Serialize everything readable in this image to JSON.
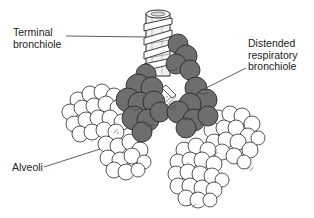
{
  "diagram": {
    "labels": [
      {
        "id": "terminal-bronchiole",
        "line1": "Terminal",
        "line2": "bronchiole"
      },
      {
        "id": "distended-respiratory-bronchiole",
        "line1": "Distended",
        "line2": "respiratory",
        "line3": "bronchiole"
      },
      {
        "id": "alveoli",
        "line1": "Alveoli"
      }
    ],
    "colors": {
      "background": "#ffffff",
      "outline": "#2a2a2a",
      "bronchiole_fill": "#6e6e6e",
      "bronchiole_shade": "#4a4a4a",
      "alveoli_fill": "#ffffff",
      "tube_fill": "#f2f2f2",
      "leader_line": "#333333"
    }
  }
}
